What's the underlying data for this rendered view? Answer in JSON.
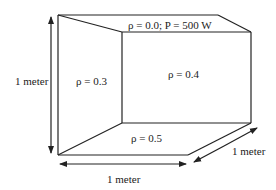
{
  "diagram": {
    "type": "room-box-3d",
    "surfaces": {
      "ceiling": "ρ = 0.0; P = 500 W",
      "left_wall": "ρ = 0.3",
      "back_wall": "ρ = 0.4",
      "floor": "ρ = 0.5"
    },
    "dimensions": {
      "height": "1 meter",
      "width": "1 meter",
      "depth": "1 meter"
    },
    "colors": {
      "line": "#222222",
      "background": "#ffffff"
    }
  }
}
